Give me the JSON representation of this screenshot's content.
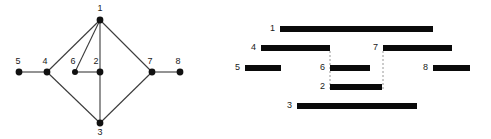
{
  "figure": {
    "width": 491,
    "height": 139,
    "background": "#ffffff",
    "ink_color": "#0a0a0a",
    "edge_color": "#3b3b3b",
    "guide_color": "#8c8c8c"
  },
  "graph": {
    "caption": "",
    "nodes": [
      {
        "id": "1",
        "label": "1",
        "cx": 100,
        "cy": 20,
        "r": 3.4,
        "label_x": 100,
        "label_y": 11
      },
      {
        "id": "2",
        "label": "2",
        "cx": 100,
        "cy": 72,
        "r": 3.4,
        "label_x": 96,
        "label_y": 64
      },
      {
        "id": "3",
        "label": "3",
        "cx": 100,
        "cy": 123,
        "r": 3.4,
        "label_x": 100,
        "label_y": 135
      },
      {
        "id": "4",
        "label": "4",
        "cx": 47,
        "cy": 72,
        "r": 3.4,
        "label_x": 45,
        "label_y": 64
      },
      {
        "id": "5",
        "label": "5",
        "cx": 19,
        "cy": 72,
        "r": 3.4,
        "label_x": 18,
        "label_y": 64
      },
      {
        "id": "6",
        "label": "6",
        "cx": 75,
        "cy": 72,
        "r": 3.0,
        "label_x": 73,
        "label_y": 64
      },
      {
        "id": "7",
        "label": "7",
        "cx": 152,
        "cy": 72,
        "r": 3.4,
        "label_x": 150,
        "label_y": 64
      },
      {
        "id": "8",
        "label": "8",
        "cx": 180,
        "cy": 72,
        "r": 3.4,
        "label_x": 178,
        "label_y": 64
      }
    ],
    "edges": [
      {
        "from": "5",
        "to": "4",
        "x1": 19,
        "y1": 72,
        "x2": 47,
        "y2": 72
      },
      {
        "from": "4",
        "to": "1",
        "x1": 47,
        "y1": 72,
        "x2": 100,
        "y2": 20
      },
      {
        "from": "6",
        "to": "1",
        "x1": 75,
        "y1": 72,
        "x2": 100,
        "y2": 20
      },
      {
        "from": "2",
        "to": "1",
        "x1": 100,
        "y1": 72,
        "x2": 100,
        "y2": 20
      },
      {
        "from": "1",
        "to": "7",
        "x1": 100,
        "y1": 20,
        "x2": 152,
        "y2": 72
      },
      {
        "from": "6",
        "to": "2",
        "x1": 75,
        "y1": 72,
        "x2": 100,
        "y2": 72
      },
      {
        "from": "4",
        "to": "3",
        "x1": 47,
        "y1": 72,
        "x2": 100,
        "y2": 123
      },
      {
        "from": "2",
        "to": "3",
        "x1": 100,
        "y1": 72,
        "x2": 100,
        "y2": 123
      },
      {
        "from": "3",
        "to": "7",
        "x1": 100,
        "y1": 123,
        "x2": 152,
        "y2": 72
      },
      {
        "from": "7",
        "to": "8",
        "x1": 152,
        "y1": 72,
        "x2": 180,
        "y2": 72
      }
    ]
  },
  "intervals": {
    "caption": "",
    "bars": [
      {
        "id": "1",
        "label": "1",
        "x": 55,
        "y": 26,
        "width": 153,
        "height": 6,
        "label_x": 50,
        "label_y": 31
      },
      {
        "id": "4",
        "label": "4",
        "x": 36,
        "y": 45,
        "width": 69,
        "height": 6,
        "label_x": 31,
        "label_y": 50
      },
      {
        "id": "7",
        "label": "7",
        "x": 158,
        "y": 45,
        "width": 69,
        "height": 6,
        "label_x": 153,
        "label_y": 50
      },
      {
        "id": "5",
        "label": "5",
        "x": 20,
        "y": 65,
        "width": 36,
        "height": 6,
        "label_x": 15,
        "label_y": 70
      },
      {
        "id": "6",
        "label": "6",
        "x": 105,
        "y": 65,
        "width": 40,
        "height": 6,
        "label_x": 100,
        "label_y": 70
      },
      {
        "id": "8",
        "label": "8",
        "x": 208,
        "y": 65,
        "width": 37,
        "height": 6,
        "label_x": 203,
        "label_y": 70
      },
      {
        "id": "2",
        "label": "2",
        "x": 105,
        "y": 84,
        "width": 52,
        "height": 6,
        "label_x": 100,
        "label_y": 89
      },
      {
        "id": "3",
        "label": "3",
        "x": 72,
        "y": 103,
        "width": 120,
        "height": 6,
        "label_x": 67,
        "label_y": 108
      }
    ],
    "guides": [
      {
        "id": "guide-left",
        "x": 105,
        "y1": 51,
        "y2": 90
      },
      {
        "id": "guide-right",
        "x": 158,
        "y1": 51,
        "y2": 90
      }
    ]
  }
}
